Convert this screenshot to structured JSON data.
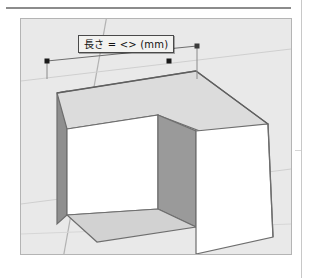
{
  "document": {
    "page_background": "#ffffff",
    "top_rule_color": "#8c8c8c",
    "page_edge_color": "#c8c8c8"
  },
  "viewport": {
    "name": "3d-model-viewport",
    "background_color": "#e9e9e9",
    "border_color": "#b4b4b4",
    "width": 272,
    "height": 237
  },
  "measurement": {
    "tooltip_text": "長さ = <> (mm)",
    "tooltip_background": "#f2f2f0",
    "tooltip_border": "#4a4a4a",
    "endpoint_color": "#1a1a1a",
    "guide_color": "#7a7a7a"
  },
  "model": {
    "name": "notched-box",
    "faces": [
      {
        "name": "top-face",
        "fill": "#dcdcdc",
        "stroke": "#6e6e6e"
      },
      {
        "name": "front-right-face",
        "fill": "#ffffff",
        "stroke": "#6e6e6e"
      },
      {
        "name": "notch-left-face",
        "fill": "#ffffff",
        "stroke": "#6e6e6e"
      },
      {
        "name": "notch-right-face",
        "fill": "#9a9a9a",
        "stroke": "#6e6e6e"
      },
      {
        "name": "notch-floor-face",
        "fill": "#d2d2d2",
        "stroke": "#6e6e6e"
      },
      {
        "name": "left-side-face",
        "fill": "#8f8f8f",
        "stroke": "#6e6e6e"
      }
    ],
    "ground_lines": [
      {
        "name": "axis-line-diagonal",
        "color": "#b0b0b0"
      },
      {
        "name": "horizon-line",
        "color": "#c4c4c4"
      }
    ]
  }
}
